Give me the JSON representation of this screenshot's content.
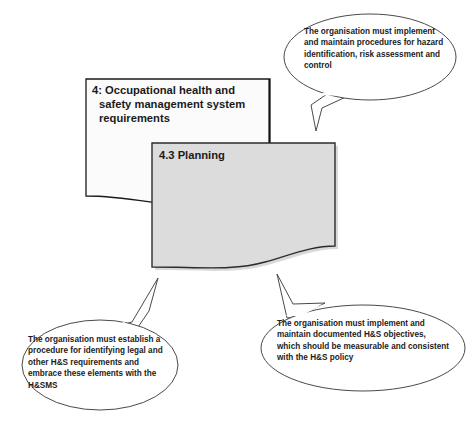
{
  "diagram": {
    "title": "4: Occupational health and safety management system requirements",
    "boxes": [
      {
        "id": "section-4-box",
        "label": "4: Occupational health and\n   safety management system\n   requirements",
        "fill": "#fbfbfb",
        "stroke": "#1a1a1a"
      },
      {
        "id": "planning-shape",
        "label": "4.3 Planning",
        "fill": "#dcdcdc",
        "stroke": "#2b2b2b"
      }
    ],
    "callouts": [
      {
        "id": "callout-hazard-identification",
        "position": "top-right",
        "text": "The organisation must implement and maintain procedures for hazard identification, risk assessment and control",
        "fill": "#ffffff",
        "stroke": "#4a4a4a"
      },
      {
        "id": "callout-legal-requirements",
        "position": "bottom-left",
        "text": "The organisation must establish a procedure for identifying legal and other H&S requirements and embrace these elements with the H&SMS",
        "fill": "#ffffff",
        "stroke": "#4a4a4a"
      },
      {
        "id": "callout-hs-objectives",
        "position": "bottom-right",
        "text": "The organisation must implement and maintain documented H&S objectives, which should be measurable and consistent with the H&S policy",
        "fill": "#ffffff",
        "stroke": "#4a4a4a"
      }
    ],
    "colors": {
      "background": "#ffffff",
      "box_fill_light": "#fbfbfb",
      "box_fill_grey": "#dcdcdc",
      "outline": "#1a1a1a",
      "callout_outline": "#4a4a4a",
      "text": "#1a1a1a"
    }
  }
}
